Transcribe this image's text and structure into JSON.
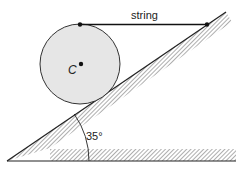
{
  "diagram": {
    "labels": {
      "string": "string",
      "center": "C",
      "angle": "35°"
    },
    "angle_deg": 35,
    "colors": {
      "disc_fill": "#e6e6e6",
      "line": "#222222"
    }
  }
}
